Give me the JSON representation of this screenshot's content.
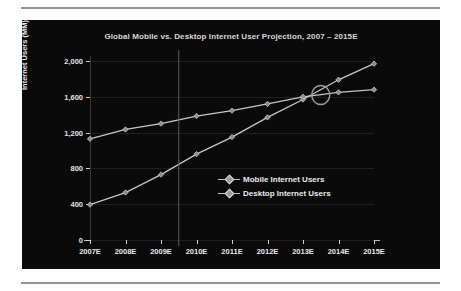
{
  "page": {
    "divider_top": "horizontal-rule",
    "divider_bottom": "horizontal-rule"
  },
  "chart_data": {
    "type": "line",
    "title": "Global Mobile vs. Desktop Internet User Projection, 2007 – 2015E",
    "xlabel": "",
    "ylabel": "Internet Users (MM)",
    "categories": [
      "2007E",
      "2008E",
      "2009E",
      "2010E",
      "2011E",
      "2012E",
      "2013E",
      "2014E",
      "2015E"
    ],
    "ylim": [
      0,
      2000
    ],
    "yticks": [
      0,
      400,
      800,
      1200,
      1600,
      2000
    ],
    "ytick_labels": [
      "0",
      "400",
      "800",
      "1,200",
      "1,600",
      "2,000"
    ],
    "grid": true,
    "legend_position": "center-right-inside",
    "series": [
      {
        "name": "Mobile Internet Users",
        "color": "#c6c6c6",
        "values": [
          395,
          530,
          730,
          960,
          1150,
          1370,
          1570,
          1790,
          1970
        ]
      },
      {
        "name": "Desktop Internet Users",
        "color": "#c6c6c6",
        "values": [
          1130,
          1235,
          1300,
          1385,
          1445,
          1520,
          1600,
          1650,
          1680
        ]
      }
    ],
    "annotations": [
      {
        "type": "ellipse-highlight",
        "name": "crossover-highlight",
        "label": "",
        "x_between": [
          "2013E",
          "2014E"
        ],
        "y_approx": 1620
      },
      {
        "type": "vertical-reference-line",
        "name": "projection-divider",
        "x_between": [
          "2009E",
          "2010E"
        ]
      }
    ]
  }
}
